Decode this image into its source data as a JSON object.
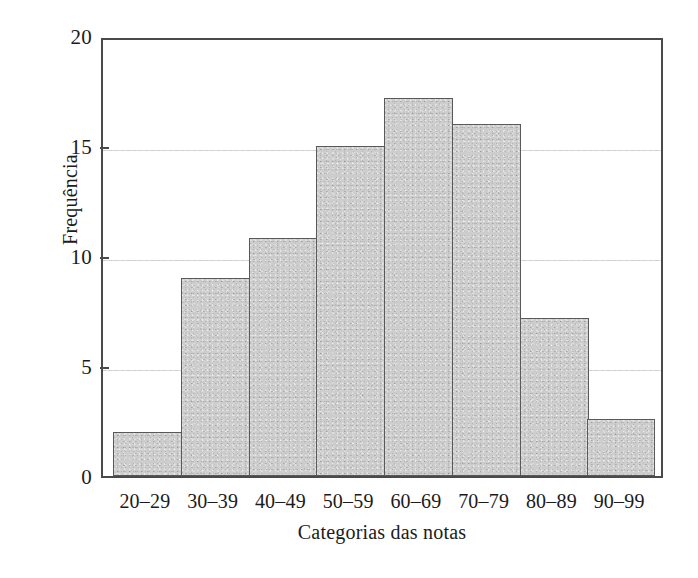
{
  "chart_data": {
    "type": "bar",
    "title": "",
    "subtitle": "",
    "xlabel": "Categorias das notas",
    "ylabel": "Frequência",
    "categories": [
      "20–29",
      "30–39",
      "40–49",
      "50–59",
      "60–69",
      "70–79",
      "80–89",
      "90–99"
    ],
    "values": [
      2,
      9,
      10.8,
      15,
      17.2,
      16,
      7.2,
      2.6
    ],
    "ylim": [
      0,
      20
    ],
    "y_ticks": [
      0,
      5,
      10,
      15,
      20
    ],
    "y_tick_labels": [
      "0",
      "5",
      "10",
      "15",
      "20"
    ],
    "grid": "horizontal-dotted",
    "legend": "none",
    "bar_fill_color": "#cdcdcd",
    "bar_edge_color": "#595959",
    "gridline_color": "#cfcfcf",
    "axis_color": "#4a4a4a",
    "background_color": "#ffffff",
    "bars_contiguous": true
  },
  "figure": {
    "kind": "histogram",
    "axis_label_y": "Frequência",
    "axis_label_x": "Categorias das notas"
  }
}
